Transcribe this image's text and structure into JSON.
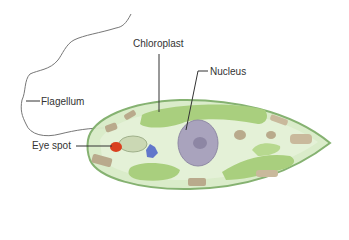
{
  "diagram": {
    "labels": {
      "chloroplast": "Chloroplast",
      "nucleus": "Nucleus",
      "flagellum": "Flagellum",
      "eye_spot": "Eye spot"
    },
    "colors": {
      "cell_body": "#d9ebc8",
      "cell_outline": "#7fae6a",
      "chloroplast": "#a9cf7e",
      "nucleus": "#a9a3bd",
      "eye_spot": "#d9401f",
      "granules": "#b9aa8c",
      "vacuole": "#4b62c9",
      "leader_line": "#333333",
      "flagellum_line": "#777777"
    }
  }
}
